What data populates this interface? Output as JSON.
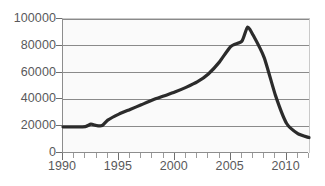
{
  "chart_data": {
    "type": "line",
    "title": "",
    "subtitle": "",
    "xlabel": "",
    "ylabel": "",
    "xlim": [
      1990,
      2012
    ],
    "ylim": [
      0,
      100000
    ],
    "grid": true,
    "legend": false,
    "legend_position": "none",
    "line_color": "#2b2b2b",
    "grid_color": "#8a8a8a",
    "axis_color": "#8d8d8d",
    "plot_background": "#fafafa",
    "tick_label_color": "#59595b",
    "y_ticks": [
      0,
      20000,
      40000,
      60000,
      80000,
      100000
    ],
    "y_tick_labels": [
      "0",
      "20000",
      "40000",
      "60000",
      "80000",
      "100000"
    ],
    "x_ticks": [
      1990,
      1995,
      2000,
      2005,
      2010
    ],
    "x_tick_labels": [
      "1990",
      "1995",
      "2000",
      "2005",
      "2010"
    ],
    "x_minor_ticks": [
      1990,
      1991,
      1992,
      1993,
      1994,
      1995,
      1996,
      1997,
      1998,
      1999,
      2000,
      2001,
      2002,
      2003,
      2004,
      2005,
      2006,
      2007,
      2008,
      2009,
      2010,
      2011,
      2012
    ],
    "x": [
      1990,
      1991,
      1992,
      1992.5,
      1993,
      1993.5,
      1994,
      1995,
      1996,
      1997,
      1998,
      1999,
      2000,
      2001,
      2002,
      2003,
      2004,
      2005,
      2006,
      2006.5,
      2007,
      2008,
      2009,
      2010,
      2011,
      2012
    ],
    "values": [
      19500,
      19500,
      19700,
      21500,
      20500,
      20500,
      24500,
      29000,
      32500,
      36000,
      39500,
      42500,
      45500,
      49000,
      53000,
      59000,
      68000,
      79500,
      83500,
      94000,
      88000,
      71000,
      43000,
      22000,
      14500,
      11500
    ],
    "series": [
      {
        "name": "value",
        "values": [
          19500,
          19500,
          19700,
          21500,
          20500,
          20500,
          24500,
          29000,
          32500,
          36000,
          39500,
          42500,
          45500,
          49000,
          53000,
          59000,
          68000,
          79500,
          83500,
          94000,
          88000,
          71000,
          43000,
          22000,
          14500,
          11500
        ]
      }
    ],
    "annotations": []
  }
}
